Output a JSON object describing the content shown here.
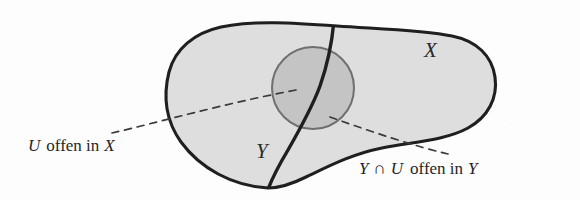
{
  "figure": {
    "domain_note": "Scanned textbook illustration of a topological space X with subspace Y and open set U",
    "background_color": "#fdfdfd",
    "labels": {
      "ambient_space": "X",
      "subspace": "Y"
    },
    "captions": {
      "left": {
        "full_text": "U offen in X",
        "set_symbol": "U",
        "predicate": "offen in",
        "ambient_symbol": "X"
      },
      "right": {
        "full_text": "Y ∩ U offen in Y",
        "first_symbol": "Y",
        "operator": "∩",
        "second_symbol": "U",
        "predicate": "offen in",
        "ambient_symbol": "Y"
      }
    },
    "colors": {
      "ink": "#2a2a2a",
      "blob_fill": "#dedede",
      "blob_stroke": "#1f1f1f",
      "circle_fill": "#c6c6c6",
      "circle_stroke": "#6f6f6f",
      "dashed_leader": "#3a3a3a"
    },
    "geometry": {
      "blob_outline_note": "Large rounded amoeba shape spanning roughly x=168..497, y=24..188",
      "circle_u": {
        "cx": 313,
        "cy": 88,
        "r": 41
      },
      "y_curve_note": "Thick curve entering top boundary near (332,27) and exiting bottom boundary near (268,186)",
      "leader_left": {
        "from_x": 112,
        "from_y": 133,
        "to_x": 296,
        "to_y": 90
      },
      "leader_right": {
        "from_x": 448,
        "from_y": 154,
        "to_x": 330,
        "to_y": 117
      }
    }
  }
}
